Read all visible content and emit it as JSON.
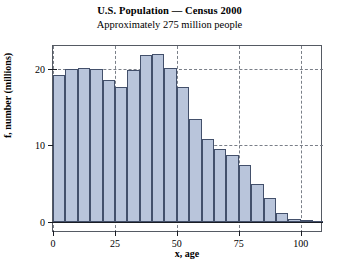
{
  "chart_data": {
    "type": "bar",
    "title": "U.S. Population — Census 2000",
    "subtitle": "Approximately 275 million people",
    "xlabel": "x, age",
    "ylabel": "f, number (millions)",
    "xlim": [
      0,
      109
    ],
    "ylim": [
      0,
      23
    ],
    "grid": true,
    "legend": null,
    "bin_width": 5,
    "categories": [
      "0-5",
      "5-10",
      "10-15",
      "15-20",
      "20-25",
      "25-30",
      "30-35",
      "35-40",
      "40-45",
      "45-50",
      "50-55",
      "55-60",
      "60-65",
      "65-70",
      "70-75",
      "75-80",
      "80-85",
      "85-90",
      "90-95",
      "95-100",
      "100-105",
      "105-110"
    ],
    "bin_starts": [
      0,
      5,
      10,
      15,
      20,
      25,
      30,
      35,
      40,
      45,
      50,
      55,
      60,
      65,
      70,
      75,
      80,
      85,
      90,
      95,
      100,
      105
    ],
    "values": [
      19.2,
      20.0,
      20.1,
      20.0,
      18.6,
      17.6,
      19.8,
      21.8,
      22.0,
      20.1,
      17.6,
      13.5,
      10.8,
      9.6,
      8.8,
      7.4,
      5.0,
      3.1,
      1.2,
      0.4,
      0.2,
      0.1
    ],
    "xticks": [
      0,
      25,
      50,
      75,
      100
    ],
    "xtick_labels": [
      "0",
      "25",
      "50",
      "75",
      "100"
    ],
    "yticks": [
      0,
      10,
      20
    ],
    "ytick_labels": [
      "0",
      "10",
      "20"
    ],
    "bar_fill_color": "#b9c5db",
    "bar_edge_color": "#43506b",
    "grid_color": "#7a7f88",
    "axis_color": "#1a1d24"
  }
}
